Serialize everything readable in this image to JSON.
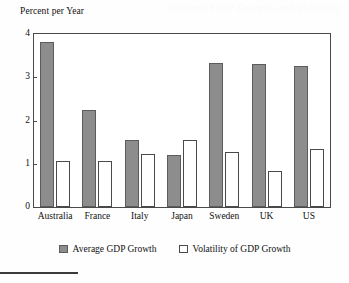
{
  "figure": {
    "ghost_text": "Nominal GDP Growth and Volatility",
    "bottom_rule": "horizontal-rule"
  },
  "chart_data": {
    "type": "bar",
    "title": "",
    "xlabel": "",
    "ylabel": "Percent per Year",
    "ylim": [
      0,
      4
    ],
    "yticks": [
      "0",
      "1",
      "2",
      "3",
      "4"
    ],
    "grid": false,
    "legend_position": "bottom",
    "categories": [
      "Australia",
      "France",
      "Italy",
      "Japan",
      "Sweden",
      "UK",
      "US"
    ],
    "series": [
      {
        "name": "Average GDP Growth",
        "color": "#8d8d8d",
        "values": [
          3.82,
          2.24,
          1.55,
          1.21,
          3.32,
          3.3,
          3.27
        ]
      },
      {
        "name": "Volatility of GDP Growth",
        "color": "#ffffff",
        "values": [
          1.07,
          1.06,
          1.22,
          1.55,
          1.28,
          0.84,
          1.33
        ]
      }
    ]
  }
}
